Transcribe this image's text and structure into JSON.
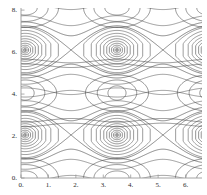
{
  "chart_data": {
    "type": "line",
    "title": "",
    "subtitle": "",
    "xlabel": "",
    "ylabel": "",
    "xlim": [
      0,
      6.6
    ],
    "ylim": [
      0,
      8.1
    ],
    "grid": false,
    "legend": null,
    "xticks": [
      0,
      1,
      2,
      3,
      4,
      5,
      6
    ],
    "xtick_labels": [
      "0.",
      "1.",
      "2.",
      "3.",
      "4.",
      "5.",
      "6."
    ],
    "yticks": [
      0,
      2,
      4,
      6,
      8
    ],
    "ytick_labels": [
      "0.",
      "2.",
      "4.",
      "6.",
      "8."
    ],
    "line_color": "#3a3a3a",
    "axis_color": "#8a8a8a",
    "background_color": "#ffffff",
    "structure": {
      "island_centers_x": [
        0.15,
        3.5,
        6.85
      ],
      "resonance_rows_y": [
        2.05,
        6.1
      ],
      "small_island_row_y": 4.05,
      "x_point_x": [
        1.82,
        5.17
      ],
      "x_point_y": [
        2.05,
        6.1
      ],
      "separatrix_halfwidth": 1.15,
      "rings_per_large_island": 11,
      "rings_per_small_island": 3,
      "period_x": 3.35,
      "arc_row_y": [
        0.0,
        8.1
      ]
    }
  },
  "axes": {
    "x_ticks": [
      {
        "label": "0.",
        "value": 0
      },
      {
        "label": "1.",
        "value": 1
      },
      {
        "label": "2.",
        "value": 2
      },
      {
        "label": "3.",
        "value": 3
      },
      {
        "label": "4.",
        "value": 4
      },
      {
        "label": "5.",
        "value": 5
      },
      {
        "label": "6.",
        "value": 6
      }
    ],
    "y_ticks": [
      {
        "label": "0.",
        "value": 0
      },
      {
        "label": "2.",
        "value": 2
      },
      {
        "label": "4.",
        "value": 4
      },
      {
        "label": "6.",
        "value": 6
      },
      {
        "label": "8.",
        "value": 8
      }
    ]
  }
}
